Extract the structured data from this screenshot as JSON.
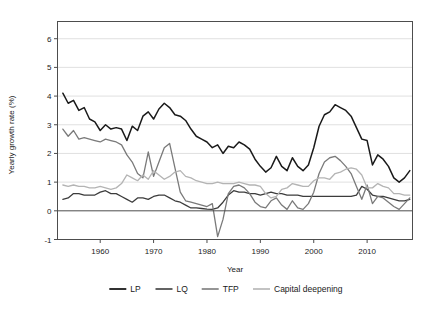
{
  "chart_data": {
    "type": "line",
    "title": "",
    "xlabel": "Year",
    "ylabel": "Yearly growth rate (%)",
    "xlim": [
      1952.0,
      2018.5
    ],
    "ylim": [
      -1.0,
      6.6
    ],
    "xticks": [
      1960,
      1970,
      1980,
      1990,
      2000,
      2010
    ],
    "xtick_labels": [
      "1960",
      "1970",
      "1980",
      "1990",
      "2000",
      "2010"
    ],
    "yticks": [
      -1,
      0,
      1,
      2,
      3,
      4,
      5,
      6
    ],
    "ytick_labels": [
      "-1",
      "0",
      "1",
      "2",
      "3",
      "4",
      "5",
      "6"
    ],
    "grid": "horizontal",
    "legend_position": "bottom",
    "x": [
      1953,
      1954,
      1955,
      1956,
      1957,
      1958,
      1959,
      1960,
      1961,
      1962,
      1963,
      1964,
      1965,
      1966,
      1967,
      1968,
      1969,
      1970,
      1971,
      1972,
      1973,
      1974,
      1975,
      1976,
      1977,
      1978,
      1979,
      1980,
      1981,
      1982,
      1983,
      1984,
      1985,
      1986,
      1987,
      1988,
      1989,
      1990,
      1991,
      1992,
      1993,
      1994,
      1995,
      1996,
      1997,
      1998,
      1999,
      2000,
      2001,
      2002,
      2003,
      2004,
      2005,
      2006,
      2007,
      2008,
      2009,
      2010,
      2011,
      2012,
      2013,
      2014,
      2015,
      2016,
      2017,
      2018
    ],
    "series": [
      {
        "name": "LP",
        "color": "#1a1a1a",
        "width": 1.5,
        "values": [
          4.1,
          3.75,
          3.85,
          3.5,
          3.6,
          3.2,
          3.1,
          2.8,
          3.0,
          2.85,
          2.9,
          2.85,
          2.45,
          2.95,
          2.8,
          3.3,
          3.45,
          3.2,
          3.55,
          3.75,
          3.6,
          3.35,
          3.3,
          3.15,
          2.85,
          2.6,
          2.5,
          2.4,
          2.2,
          2.3,
          2.0,
          2.25,
          2.2,
          2.4,
          2.3,
          2.15,
          1.8,
          1.55,
          1.35,
          1.5,
          1.9,
          1.55,
          1.4,
          1.85,
          1.55,
          1.4,
          1.6,
          2.2,
          2.95,
          3.35,
          3.45,
          3.7,
          3.6,
          3.5,
          3.3,
          2.9,
          2.5,
          2.45,
          1.6,
          1.95,
          1.8,
          1.55,
          1.15,
          1.0,
          1.15,
          1.4
        ]
      },
      {
        "name": "LQ",
        "color": "#3c3c3c",
        "width": 1.3,
        "values": [
          0.4,
          0.45,
          0.6,
          0.6,
          0.55,
          0.55,
          0.55,
          0.65,
          0.7,
          0.6,
          0.6,
          0.5,
          0.4,
          0.3,
          0.45,
          0.45,
          0.4,
          0.5,
          0.55,
          0.55,
          0.45,
          0.35,
          0.3,
          0.2,
          0.1,
          0.1,
          0.08,
          0.06,
          0.05,
          0.1,
          0.3,
          0.55,
          0.7,
          0.65,
          0.65,
          0.6,
          0.6,
          0.55,
          0.6,
          0.65,
          0.6,
          0.6,
          0.55,
          0.55,
          0.55,
          0.5,
          0.5,
          0.5,
          0.5,
          0.5,
          0.5,
          0.5,
          0.5,
          0.5,
          0.5,
          0.55,
          0.85,
          0.75,
          0.55,
          0.5,
          0.5,
          0.45,
          0.4,
          0.35,
          0.35,
          0.4
        ]
      },
      {
        "name": "TFP",
        "color": "#7a7a7a",
        "width": 1.3,
        "values": [
          2.85,
          2.6,
          2.8,
          2.5,
          2.55,
          2.5,
          2.45,
          2.4,
          2.5,
          2.45,
          2.4,
          2.3,
          1.95,
          1.7,
          1.3,
          1.15,
          2.05,
          1.2,
          1.7,
          2.2,
          2.35,
          1.5,
          0.65,
          0.35,
          0.3,
          0.25,
          0.2,
          0.15,
          0.25,
          -0.9,
          -0.3,
          0.6,
          0.85,
          0.9,
          0.8,
          0.6,
          0.3,
          0.15,
          0.1,
          0.35,
          0.45,
          0.2,
          0.05,
          0.35,
          0.1,
          0.05,
          0.25,
          0.65,
          1.3,
          1.7,
          1.85,
          1.9,
          1.75,
          1.55,
          1.3,
          0.85,
          0.4,
          0.9,
          0.25,
          0.5,
          0.45,
          0.3,
          0.15,
          0.05,
          0.25,
          0.45
        ]
      },
      {
        "name": "Capital deepening",
        "color": "#b4b4b4",
        "width": 1.3,
        "values": [
          0.9,
          0.85,
          0.9,
          0.85,
          0.85,
          0.8,
          0.8,
          0.85,
          0.8,
          0.75,
          0.8,
          0.95,
          1.25,
          1.15,
          1.05,
          1.25,
          1.1,
          1.4,
          1.25,
          1.1,
          1.2,
          1.35,
          1.4,
          1.2,
          1.15,
          1.05,
          1.0,
          0.95,
          0.95,
          1.0,
          0.95,
          0.95,
          0.95,
          1.0,
          0.95,
          0.9,
          0.9,
          0.85,
          0.6,
          0.45,
          0.5,
          0.75,
          0.8,
          0.95,
          0.9,
          0.85,
          0.85,
          1.05,
          1.15,
          1.15,
          1.1,
          1.3,
          1.35,
          1.45,
          1.5,
          1.45,
          1.25,
          0.8,
          0.8,
          0.95,
          0.85,
          0.8,
          0.6,
          0.6,
          0.55,
          0.55
        ]
      }
    ]
  },
  "legend": {
    "items": [
      {
        "label": "LP"
      },
      {
        "label": "LQ"
      },
      {
        "label": "TFP"
      },
      {
        "label": "Capital deepening"
      }
    ]
  }
}
